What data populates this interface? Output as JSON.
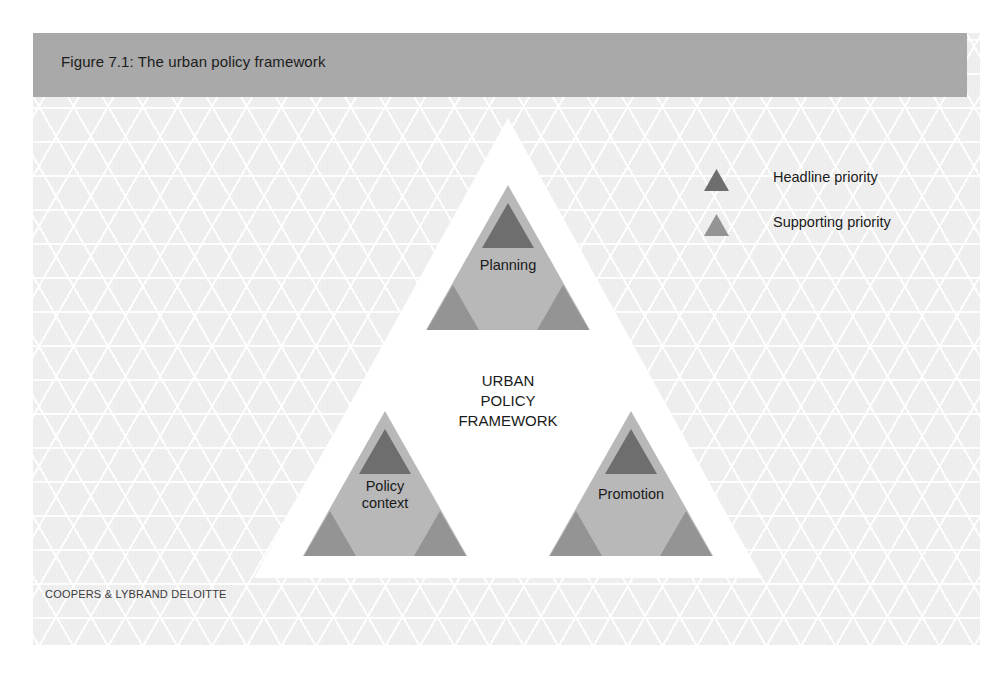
{
  "figure": {
    "title": "Figure 7.1: The urban policy framework",
    "credit": "COOPERS & LYBRAND DELOITTE",
    "center_text": "URBAN\nPOLICY\nFRAMEWORK"
  },
  "colors": {
    "header_bar": "#a9a9a9",
    "panel_background": "#ececec",
    "lattice_line": "#ffffff",
    "main_triangle": "#ffffff",
    "node_fill": "#b8b8b8",
    "headline_priority": "#6e6e6e",
    "supporting_priority": "#949494",
    "text": "#1a1a1a"
  },
  "nodes": [
    {
      "id": "planning",
      "label": "Planning",
      "position": "top",
      "headline_count": 1,
      "supporting_count": 2
    },
    {
      "id": "policy",
      "label": "Policy\ncontext",
      "position": "bottom-left",
      "headline_count": 1,
      "supporting_count": 2
    },
    {
      "id": "promotion",
      "label": "Promotion",
      "position": "bottom-right",
      "headline_count": 1,
      "supporting_count": 2
    }
  ],
  "legend": {
    "items": [
      {
        "id": "headline",
        "label": "Headline priority",
        "icon": "triangle-icon",
        "color": "#6e6e6e"
      },
      {
        "id": "supporting",
        "label": "Supporting priority",
        "icon": "triangle-icon",
        "color": "#949494"
      }
    ]
  }
}
